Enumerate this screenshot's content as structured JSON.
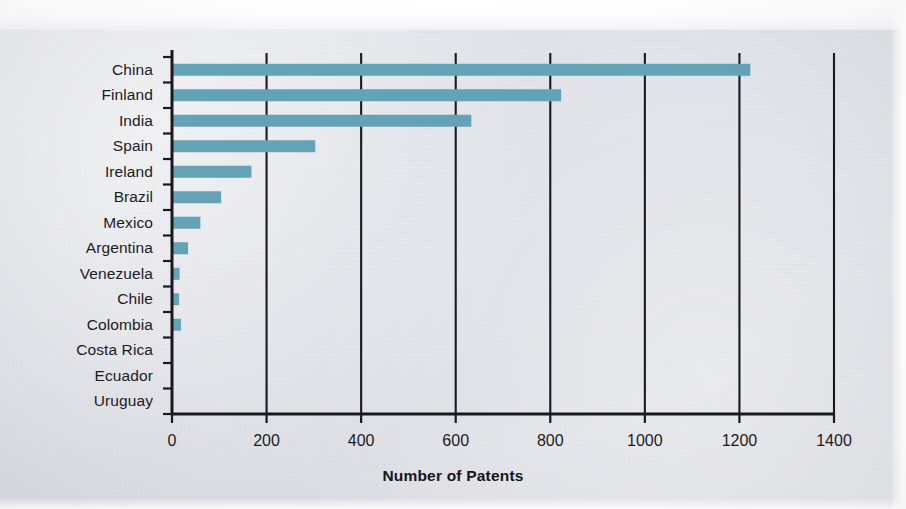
{
  "chart_data": {
    "type": "bar",
    "orientation": "horizontal",
    "title": "",
    "xlabel": "Number of Patents",
    "ylabel": "",
    "categories": [
      "China",
      "Finland",
      "India",
      "Spain",
      "Ireland",
      "Brazil",
      "Mexico",
      "Argentina",
      "Venezuela",
      "Chile",
      "Colombia",
      "Costa Rica",
      "Ecuador",
      "Uruguay"
    ],
    "values": [
      1223,
      823,
      633,
      303,
      168,
      104,
      60,
      34,
      16,
      15,
      19,
      0,
      0,
      0
    ],
    "xlim": [
      0,
      1400
    ],
    "xticks": [
      0,
      200,
      400,
      600,
      800,
      1000,
      1200,
      1400
    ],
    "xtick_labels": [
      "0",
      "200",
      "400",
      "600",
      "800",
      "1000",
      "1200",
      "1400"
    ],
    "grid": true,
    "grid_axis": "x",
    "legend": false,
    "bar_color": "#63a3b5",
    "axis_color": "#1a1a1e",
    "background_color": "#e2e3e8"
  }
}
